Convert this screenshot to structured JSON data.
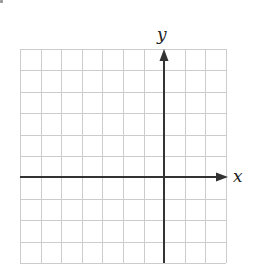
{
  "diagram": {
    "type": "coordinate-grid",
    "x_label": "x",
    "y_label": "y",
    "grid": {
      "columns": 10,
      "rows": 10,
      "columns_left_of_y_axis": 7,
      "columns_right_of_y_axis": 3,
      "rows_above_x_axis": 6,
      "rows_below_x_axis": 4,
      "left_px": 20,
      "top_px": 49,
      "cell_width_px": 20.6,
      "cell_height_px": 21.4
    },
    "colors": {
      "grid_line": "#cccccc",
      "axis": "#333333",
      "label": "#222222",
      "background": "#ffffff"
    }
  }
}
